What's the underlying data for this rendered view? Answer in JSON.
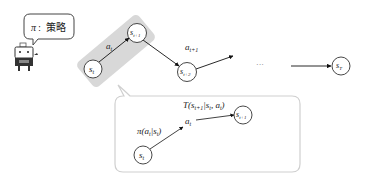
{
  "policy_bubble": {
    "symbol": "π",
    "separator": ":",
    "label": "策略"
  },
  "agent": {
    "icon": "robot-icon"
  },
  "trajectory": {
    "states": [
      {
        "id": "s_t",
        "base": "s",
        "sub": "t"
      },
      {
        "id": "s_t+1",
        "base": "s",
        "sub": "t+1"
      },
      {
        "id": "s_t+2",
        "base": "s",
        "sub": "t+2"
      },
      {
        "id": "s_T",
        "base": "s",
        "sub": "T"
      }
    ],
    "actions": [
      {
        "base": "a",
        "sub": "t"
      },
      {
        "base": "a",
        "sub": "t+1"
      }
    ],
    "ellipsis": "···"
  },
  "detail": {
    "state_from": {
      "base": "s",
      "sub": "t"
    },
    "state_to": {
      "base": "s",
      "sub": "t+1"
    },
    "action": {
      "base": "a",
      "sub": "t"
    },
    "policy_expr": {
      "pre": "π(a",
      "sub1": "t",
      "mid": "|s",
      "sub2": "t",
      "post": ")"
    },
    "transition_expr": {
      "pre": "T(s",
      "sub1": "t+1",
      "mid1": "|s",
      "sub2": "t",
      "mid2": ", a",
      "sub3": "t",
      "post": ")"
    }
  },
  "colors": {
    "highlight": "#d9d9d9",
    "line": "#222222",
    "box_border": "#cfcfcf"
  }
}
